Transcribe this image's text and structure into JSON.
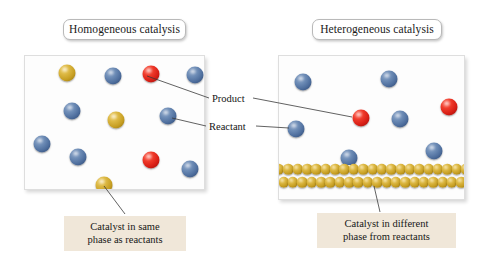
{
  "figure": {
    "type": "diagram",
    "background_color": "#ffffff"
  },
  "colors": {
    "reactant_blue": "#4f6f9e",
    "product_red": "#d81f16",
    "catalyst_gold": "#c79f23",
    "caption_background": "#f0e7d9",
    "box_border": "#dedede",
    "pill_border": "#b9b9b9",
    "text": "#141414"
  },
  "panels": [
    {
      "id": "homogeneous",
      "title": "Homogeneous catalysis",
      "caption": "Catalyst in same\nphase as reactants",
      "caption_line1": "Catalyst in same",
      "caption_line2": "phase as reactants",
      "box": {
        "x": 24,
        "y": 55,
        "width": 181,
        "height": 135
      },
      "particles": [
        {
          "species": "catalyst",
          "color": "gold",
          "x": 42,
          "y": 17,
          "r": 8.5
        },
        {
          "species": "reactant",
          "color": "blue",
          "x": 88,
          "y": 20,
          "r": 8.5
        },
        {
          "species": "product",
          "color": "red",
          "x": 126,
          "y": 18,
          "r": 8.5
        },
        {
          "species": "reactant",
          "color": "blue",
          "x": 170,
          "y": 19,
          "r": 8.5
        },
        {
          "species": "reactant",
          "color": "blue",
          "x": 47,
          "y": 55,
          "r": 8.5
        },
        {
          "species": "catalyst",
          "color": "gold",
          "x": 91,
          "y": 64,
          "r": 8.5
        },
        {
          "species": "reactant",
          "color": "blue",
          "x": 143,
          "y": 60,
          "r": 8.5
        },
        {
          "species": "reactant",
          "color": "blue",
          "x": 17,
          "y": 88,
          "r": 8.5
        },
        {
          "species": "reactant",
          "color": "blue",
          "x": 53,
          "y": 101,
          "r": 8.5
        },
        {
          "species": "product",
          "color": "red",
          "x": 126,
          "y": 104,
          "r": 8.5
        },
        {
          "species": "reactant",
          "color": "blue",
          "x": 165,
          "y": 113,
          "r": 8.5
        },
        {
          "species": "catalyst",
          "color": "gold",
          "x": 79,
          "y": 129,
          "r": 8.5
        }
      ]
    },
    {
      "id": "heterogeneous",
      "title": "Heterogeneous catalysis",
      "caption": "Catalyst in different\nphase from reactants",
      "caption_line1": "Catalyst in different",
      "caption_line2": "phase from reactants",
      "box": {
        "x": 278,
        "y": 55,
        "width": 187,
        "height": 145
      },
      "particles": [
        {
          "species": "reactant",
          "color": "blue",
          "x": 24,
          "y": 26,
          "r": 8.5
        },
        {
          "species": "reactant",
          "color": "blue",
          "x": 110,
          "y": 23,
          "r": 8.5
        },
        {
          "species": "product",
          "color": "red",
          "x": 170,
          "y": 51,
          "r": 8.5
        },
        {
          "species": "product",
          "color": "red",
          "x": 82,
          "y": 62,
          "r": 8.5
        },
        {
          "species": "reactant",
          "color": "blue",
          "x": 121,
          "y": 63,
          "r": 8.5
        },
        {
          "species": "reactant",
          "color": "blue",
          "x": 17,
          "y": 73,
          "r": 8.5
        },
        {
          "species": "reactant",
          "color": "blue",
          "x": 155,
          "y": 95,
          "r": 8.5
        },
        {
          "species": "reactant",
          "color": "blue",
          "x": 70,
          "y": 102,
          "r": 8.5
        }
      ],
      "catalyst_surface": {
        "label": "solid catalyst surface",
        "rows": 2,
        "spheres_per_row": 20,
        "color": "gold"
      }
    }
  ],
  "leader_labels": [
    {
      "id": "product",
      "text": "Product",
      "x": 212,
      "y": 94
    },
    {
      "id": "reactant",
      "text": "Reactant",
      "x": 209,
      "y": 122
    }
  ],
  "leader_lines": [
    {
      "from": "product-label-left",
      "to": "left-panel-red-sphere",
      "x1": 209,
      "y1": 98,
      "x2": 147,
      "y2": 76
    },
    {
      "from": "product-label-right",
      "to": "right-panel-red-sphere",
      "x1": 253,
      "y1": 98,
      "x2": 352,
      "y2": 117
    },
    {
      "from": "reactant-label-left",
      "to": "left-panel-blue-sphere",
      "x1": 206,
      "y1": 126,
      "x2": 172,
      "y2": 118
    },
    {
      "from": "reactant-label-right",
      "to": "right-panel-blue-sphere",
      "x1": 256,
      "y1": 126,
      "x2": 289,
      "y2": 128
    },
    {
      "from": "left-caption",
      "to": "left-panel-gold-sphere",
      "x1": 125,
      "y1": 214,
      "x2": 104,
      "y2": 186
    },
    {
      "from": "right-caption",
      "to": "right-panel-catalyst-row",
      "x1": 380,
      "y1": 212,
      "x2": 374,
      "y2": 186
    }
  ]
}
